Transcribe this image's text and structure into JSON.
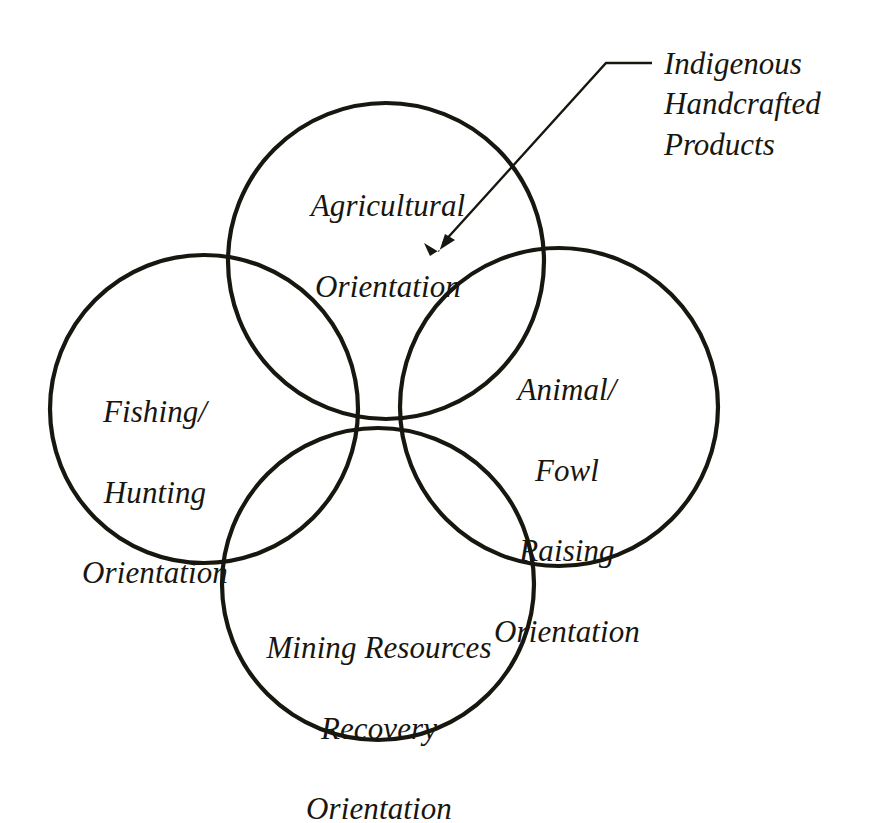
{
  "diagram": {
    "type": "four-circle-venn",
    "background_color": "#ffffff",
    "stroke_color": "#17160f",
    "text_color": "#17160f",
    "circles": [
      {
        "id": "top",
        "name": "agricultural-orientation-circle",
        "label_lines": [
          "Agricultural",
          "Orientation"
        ],
        "cx": 386,
        "cy": 261,
        "r": 158
      },
      {
        "id": "left",
        "name": "fishing-hunting-orientation-circle",
        "label_lines": [
          "Fishing/",
          "Hunting",
          "Orientation"
        ],
        "cx": 204,
        "cy": 409,
        "r": 154
      },
      {
        "id": "right",
        "name": "animal-fowl-raising-orientation-circle",
        "label_lines": [
          "Animal/",
          "Fowl",
          "Raising",
          "Orientation"
        ],
        "cx": 559,
        "cy": 407,
        "r": 159
      },
      {
        "id": "bottom",
        "name": "mining-resources-recovery-orientation-circle",
        "label_lines": [
          "Mining Resources",
          "Recovery",
          "Orientation"
        ],
        "cx": 378,
        "cy": 584,
        "r": 156
      }
    ],
    "labels": {
      "top": "Agricultural\nOrientation",
      "left": "Fishing/\nHunting\nOrientation",
      "right": "Animal/\nFowl\nRaising\nOrientation",
      "bottom": "Mining Resources\nRecovery\nOrientation"
    },
    "annotation": {
      "name": "indigenous-handcrafted-products-callout",
      "lines": [
        "Indigenous",
        "Handcrafted",
        "Products"
      ],
      "text": "Indigenous\nHandcrafted\nProducts",
      "leader": {
        "start_x": 652,
        "start_y": 63,
        "elbow_x": 606,
        "elbow_y": 63,
        "end_x": 432,
        "end_y": 254,
        "arrowhead_at": "center-intersection-region"
      }
    }
  }
}
